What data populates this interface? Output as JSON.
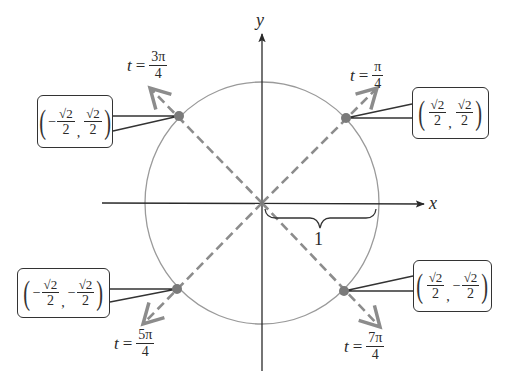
{
  "axes": {
    "x_label": "x",
    "y_label": "y",
    "radius_label": "1"
  },
  "colors": {
    "axis": "#2a2a2a",
    "circle": "#9a9a9a",
    "dashed_ray": "#8c8c8c",
    "point": "#7a7a7a",
    "box_border": "#333333"
  },
  "angles": [
    {
      "id": "pi4",
      "t_var": "t",
      "equals": "=",
      "numerator": "π",
      "denominator": "4"
    },
    {
      "id": "3pi4",
      "t_var": "t",
      "equals": "=",
      "numerator": "3π",
      "denominator": "4"
    },
    {
      "id": "5pi4",
      "t_var": "t",
      "equals": "=",
      "numerator": "5π",
      "denominator": "4"
    },
    {
      "id": "7pi4",
      "t_var": "t",
      "equals": "=",
      "numerator": "7π",
      "denominator": "4"
    }
  ],
  "points": [
    {
      "id": "q1",
      "x_sign": "",
      "x_num": "√2",
      "x_den": "2",
      "comma": ",",
      "y_sign": "",
      "y_num": "√2",
      "y_den": "2",
      "open": "(",
      "close": ")"
    },
    {
      "id": "q2",
      "x_sign": "−",
      "x_num": "√2",
      "x_den": "2",
      "comma": ",",
      "y_sign": "",
      "y_num": "√2",
      "y_den": "2",
      "open": "(",
      "close": ")"
    },
    {
      "id": "q3",
      "x_sign": "−",
      "x_num": "√2",
      "x_den": "2",
      "comma": ",",
      "y_sign": "−",
      "y_num": "√2",
      "y_den": "2",
      "open": "(",
      "close": ")"
    },
    {
      "id": "q4",
      "x_sign": "",
      "x_num": "√2",
      "x_den": "2",
      "comma": ",",
      "y_sign": "−",
      "y_num": "√2",
      "y_den": "2",
      "open": "(",
      "close": ")"
    }
  ]
}
